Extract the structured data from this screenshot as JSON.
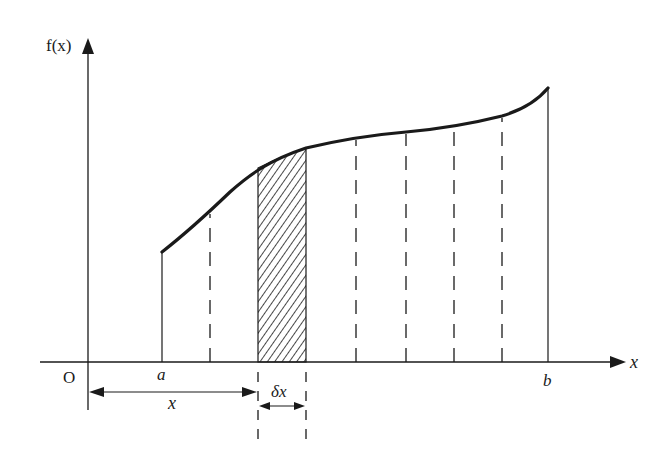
{
  "diagram": {
    "type": "definite-integral-strip",
    "colors": {
      "ink": "#1a1a1a",
      "background": "#ffffff"
    },
    "axes": {
      "y_label": "f(x)",
      "x_label": "x",
      "origin_label": "O"
    },
    "bounds": {
      "lower_label": "a",
      "upper_label": "b"
    },
    "strip": {
      "width_label": "δx",
      "fill": "hatched"
    },
    "dimension": {
      "distance_label": "x"
    },
    "curve_points": [
      [
        162,
        252
      ],
      [
        210,
        212
      ],
      [
        258,
        168
      ],
      [
        306,
        148
      ],
      [
        356,
        138
      ],
      [
        406,
        132
      ],
      [
        454,
        126
      ],
      [
        502,
        116
      ],
      [
        548,
        88
      ]
    ],
    "dashed_ordinates_x": [
      210,
      356,
      406,
      454,
      502
    ],
    "solid_ordinates_x": [
      162,
      258,
      306,
      548
    ]
  }
}
